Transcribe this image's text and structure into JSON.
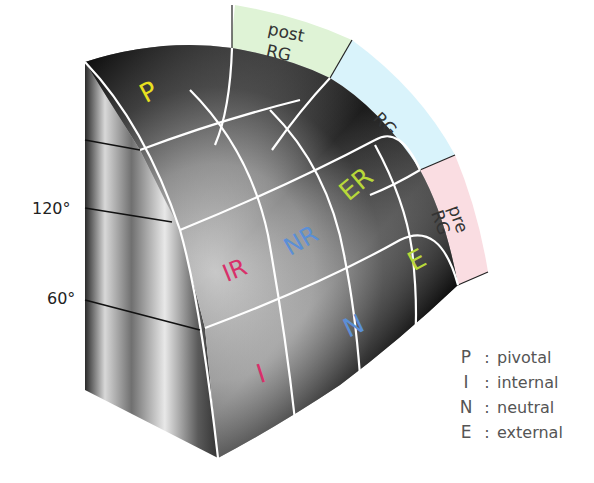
{
  "diagram": {
    "regions": [
      {
        "code": "P",
        "color": "#e8e020"
      },
      {
        "code": "IR",
        "color": "#d8306a"
      },
      {
        "code": "NR",
        "color": "#5b8fd6"
      },
      {
        "code": "ER",
        "color": "#b8d83a"
      },
      {
        "code": "I",
        "color": "#d8306a"
      },
      {
        "code": "N",
        "color": "#5b8fd6"
      },
      {
        "code": "E",
        "color": "#b8d83a"
      }
    ],
    "bands": [
      {
        "line1": "post",
        "line2": "RG",
        "color": "#dff3d6"
      },
      {
        "line1": "RG",
        "line2": "",
        "color": "#d9f3fb"
      },
      {
        "line1": "pre",
        "line2": "RG",
        "color": "#fadde2"
      }
    ],
    "angles": [
      "120°",
      "60°"
    ]
  },
  "legend": [
    {
      "key": "P",
      "sep": ":",
      "value": "pivotal"
    },
    {
      "key": "I",
      "sep": ":",
      "value": "internal"
    },
    {
      "key": "N",
      "sep": ":",
      "value": "neutral"
    },
    {
      "key": "E",
      "sep": ":",
      "value": "external"
    }
  ]
}
